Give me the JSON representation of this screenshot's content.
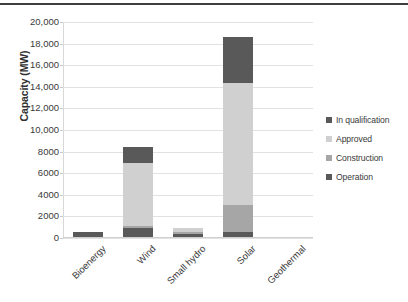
{
  "chart_data": {
    "type": "bar",
    "title": "",
    "subtitle": "",
    "xlabel": "",
    "ylabel": "Capacity (MW)",
    "stacked": true,
    "orientation": "vertical",
    "grid": true,
    "legend_position": "right",
    "ylim": [
      0,
      20000
    ],
    "ytick_step": 2000,
    "ytick_labels": [
      "20,000",
      "18,000",
      "16,000",
      "14,000",
      "12,000",
      "10,000",
      "8000",
      "6000",
      "4000",
      "2000",
      "0"
    ],
    "ytick_values": [
      20000,
      18000,
      16000,
      14000,
      12000,
      10000,
      8000,
      6000,
      4000,
      2000,
      0
    ],
    "categories": [
      "Bioenergy",
      "Wind",
      "Small hydro",
      "Solar",
      "Geothermal"
    ],
    "series": [
      {
        "name": "Operation",
        "color": "#595959",
        "values": [
          550,
          900,
          350,
          600,
          70
        ]
      },
      {
        "name": "Construction",
        "color": "#a6a6a6",
        "values": [
          0,
          200,
          200,
          2500,
          0
        ]
      },
      {
        "name": "Approved",
        "color": "#d0d0d0",
        "values": [
          0,
          5850,
          400,
          11300,
          0
        ]
      },
      {
        "name": "In qualification",
        "color": "#595959",
        "values": [
          0,
          1500,
          0,
          4250,
          0
        ]
      }
    ],
    "totals": [
      550,
      8450,
      950,
      18650,
      70
    ]
  },
  "legend": {
    "items": [
      {
        "label": "In qualification",
        "color": "#595959"
      },
      {
        "label": "Approved",
        "color": "#d0d0d0"
      },
      {
        "label": "Construction",
        "color": "#a6a6a6"
      },
      {
        "label": "Operation",
        "color": "#595959"
      }
    ]
  }
}
